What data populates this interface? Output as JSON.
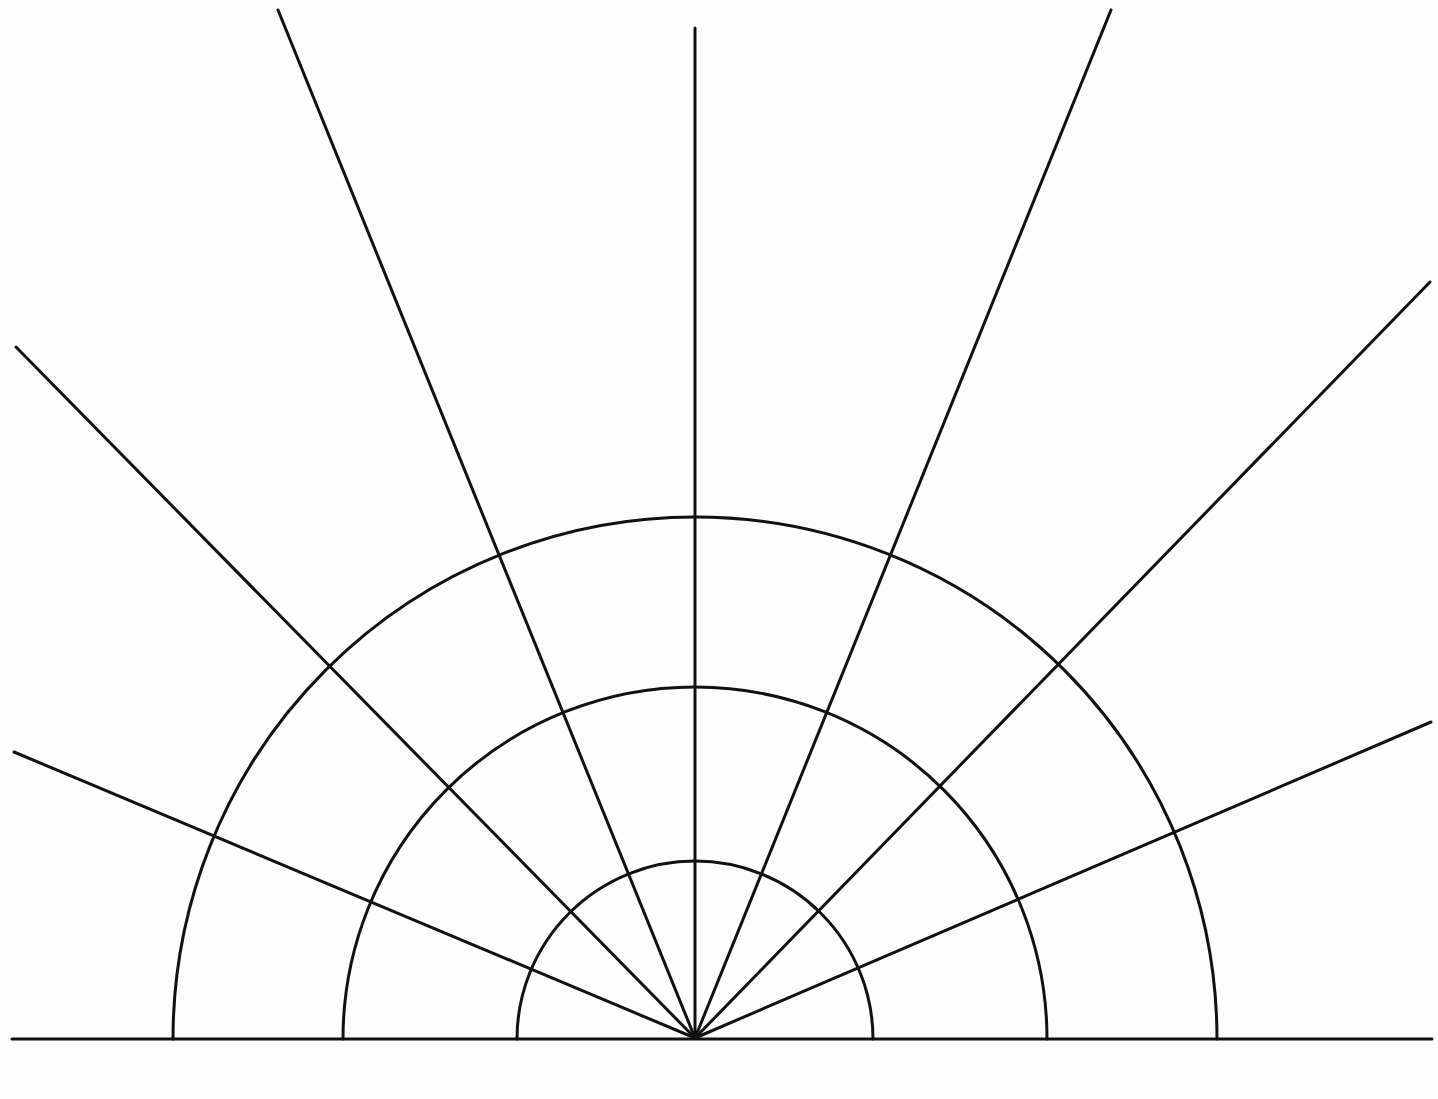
{
  "diagram": {
    "type": "polar-grid-half",
    "width": 1438,
    "height": 1099,
    "stroke_color": "#111111",
    "background": "#fdfdfd",
    "center": {
      "x": 695,
      "y": 1038
    },
    "baseline": {
      "x1": 12,
      "y1": 1039,
      "x2": 1432,
      "y2": 1039
    },
    "arcs": [
      {
        "name": "inner",
        "radius": 178
      },
      {
        "name": "middle",
        "radius": 352
      },
      {
        "name": "outer",
        "radius": 522
      }
    ],
    "rays": [
      {
        "name": "ray-left-low",
        "x2": 14,
        "y2": 752
      },
      {
        "name": "ray-left-mid",
        "x2": 16,
        "y2": 347
      },
      {
        "name": "ray-left-high",
        "x2": 278,
        "y2": 10
      },
      {
        "name": "ray-vertical",
        "x2": 695,
        "y2": 28
      },
      {
        "name": "ray-right-high",
        "x2": 1111,
        "y2": 10
      },
      {
        "name": "ray-right-mid",
        "x2": 1430,
        "y2": 282
      },
      {
        "name": "ray-right-low",
        "x2": 1431,
        "y2": 722
      }
    ]
  }
}
